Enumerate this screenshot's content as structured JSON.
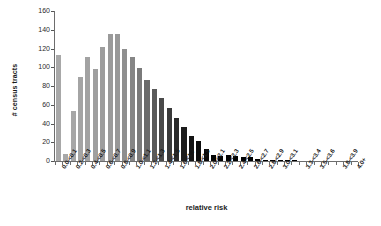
{
  "chart_data": {
    "type": "bar",
    "title": "",
    "xlabel": "relative risk",
    "ylabel": "# census tracts",
    "ylim": [
      0,
      160
    ],
    "y_ticks": [
      0,
      20,
      40,
      60,
      80,
      100,
      120,
      140,
      160
    ],
    "grid": false,
    "legend": "none",
    "bar_colors_note": "bars shade progressively from light gray (low relative risk) to black (high relative risk)",
    "categories": [
      "0.0-<0.1",
      "0.1-<0.2",
      "0.2-<0.3",
      "0.3-<0.4",
      "0.4-<0.5",
      "0.5-<0.6",
      "0.6-<0.7",
      "0.7-<0.8",
      "0.8-<0.9",
      "0.9-<1.0",
      "1.0-<1.1",
      "1.1-<1.2",
      "1.2-<1.3",
      "1.3-<1.4",
      "1.4-<1.5",
      "1.5-<1.6",
      "1.6-<1.7",
      "1.7-<1.8",
      "1.8-<1.9",
      "1.9-<2.0",
      "2.0-<2.1",
      "2.1-<2.2",
      "2.2-<2.3",
      "2.3-<2.4",
      "2.4-<2.5",
      "2.5-<2.6",
      "2.6-<2.7",
      "2.7-<2.8",
      "2.8-<2.9",
      "2.9-<3.0",
      "3.0-<3.1",
      "3.1-<3.2",
      "3.2-<3.3",
      "3.3-<3.4",
      "3.4-<3.5",
      "3.5-<3.6",
      "3.6-<3.7",
      "3.7-<3.8",
      "3.8-<3.9",
      "3.9-<4.0",
      "4.0+"
    ],
    "visible_tick_labels": [
      "0.0-<0.1",
      "0.2-<0.3",
      "0.4-<0.5",
      "0.6-<0.7",
      "0.8-<0.9",
      "1.0-<1.1",
      "1.2-<1.3",
      "1.4-<1.5",
      "1.6-<1.7",
      "1.8-<1.9",
      "2.0-<2.1",
      "2.2-<2.3",
      "2.4-<2.5",
      "2.6-<2.7",
      "2.8-<2.9",
      "3.0-<3.1",
      "3.3-<3.4",
      "3.5-<3.6",
      "3.8-<3.9",
      "4.0+"
    ],
    "values": [
      113,
      8,
      53,
      90,
      111,
      98,
      122,
      136,
      136,
      120,
      111,
      99,
      86,
      77,
      67,
      57,
      46,
      36,
      27,
      21,
      13,
      6,
      5,
      6,
      5,
      4,
      4,
      2,
      1,
      1,
      1,
      1,
      1,
      0,
      0,
      0,
      0,
      0,
      0,
      0,
      0
    ],
    "colors": [
      "#a8a8a8",
      "#a8a8a8",
      "#a6a6a6",
      "#a4a4a4",
      "#a2a2a2",
      "#9f9f9f",
      "#9d9d9d",
      "#9a9a9a",
      "#989898",
      "#8f8f8f",
      "#868686",
      "#7a7a7a",
      "#6a6a6a",
      "#5a5a5a",
      "#4a4a4a",
      "#3a3a3a",
      "#2a2a2a",
      "#1c1c1c",
      "#141414",
      "#0d0d0d",
      "#080808",
      "#050505",
      "#030303",
      "#020202",
      "#010101",
      "#000000",
      "#000000",
      "#000000",
      "#000000",
      "#000000",
      "#000000",
      "#000000",
      "#000000",
      "#000000",
      "#000000",
      "#000000",
      "#000000",
      "#000000",
      "#000000",
      "#000000",
      "#000000"
    ]
  },
  "axes": {
    "y_title": "# census tracts",
    "x_title": "relative risk"
  }
}
